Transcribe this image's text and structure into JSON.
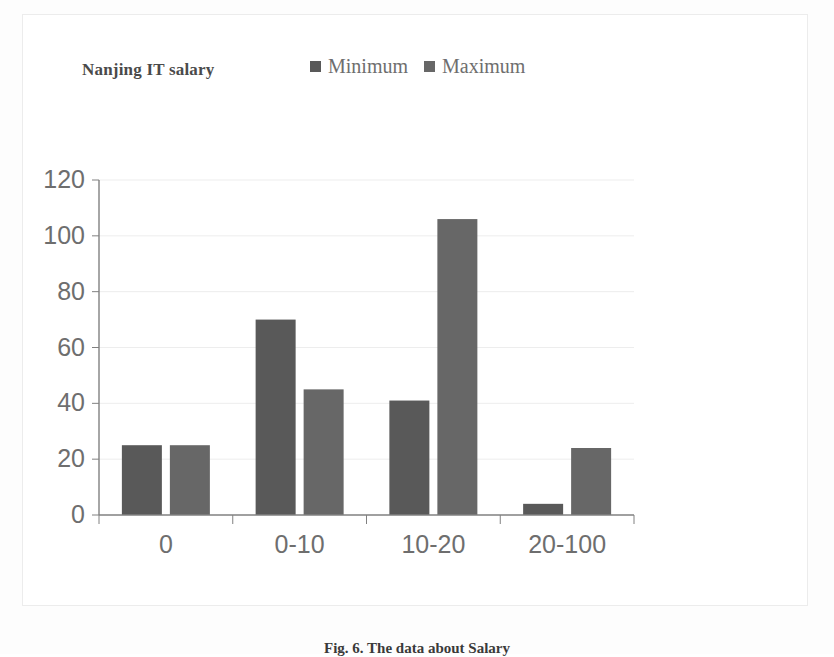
{
  "figure": {
    "caption": "Fig. 6. The data about Salary"
  },
  "chart": {
    "title": "Nanjing IT salary",
    "legend": [
      {
        "label": "Minimum",
        "color": "#595959"
      },
      {
        "label": "Maximum",
        "color": "#676767"
      }
    ]
  },
  "chart_data": {
    "type": "bar",
    "title": "Nanjing IT salary",
    "xlabel": "",
    "ylabel": "",
    "categories": [
      "0",
      "0-10",
      "10-20",
      "20-100"
    ],
    "series": [
      {
        "name": "Minimum",
        "color": "#595959",
        "values": [
          25,
          70,
          41,
          4
        ]
      },
      {
        "name": "Maximum",
        "color": "#676767",
        "values": [
          25,
          45,
          106,
          24
        ]
      }
    ],
    "ylim": [
      0,
      120
    ],
    "yticks": [
      0,
      20,
      40,
      60,
      80,
      100,
      120
    ],
    "ytick_labels": [
      "0",
      "20",
      "40",
      "60",
      "80",
      "100",
      "120"
    ],
    "grid": "horizontal",
    "legend_position": "top-right",
    "orientation": "vertical",
    "grouping": "grouped"
  },
  "axes": {
    "y_tick_labels": [
      "120",
      "100",
      "80",
      "60",
      "40",
      "20",
      "0"
    ],
    "x_tick_labels": [
      "0",
      "0-10",
      "10-20",
      "20-100"
    ]
  },
  "colors": {
    "axis": "#808080",
    "grid": "#ededed",
    "tick_text": "#6e6e6e",
    "frame": "#ececec"
  }
}
